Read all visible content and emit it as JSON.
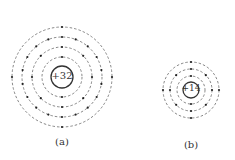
{
  "diagram": {
    "type": "atomic-structure",
    "atoms": [
      {
        "id": "a",
        "nucleus_label": "+32",
        "caption": "(a)",
        "shells": [
          2,
          8,
          18,
          4
        ],
        "center": [
          62,
          77
        ],
        "nucleus_radius": 11,
        "shell_radii": [
          20,
          30,
          40,
          50
        ]
      },
      {
        "id": "b",
        "nucleus_label": "+14",
        "caption": "(b)",
        "shells": [
          2,
          8,
          4
        ],
        "center": [
          191,
          90
        ],
        "nucleus_radius": 8,
        "shell_radii": [
          14,
          21,
          28
        ]
      }
    ],
    "colors": {
      "line": "#333333",
      "dashed": "#555555",
      "electron": "#222222"
    }
  }
}
